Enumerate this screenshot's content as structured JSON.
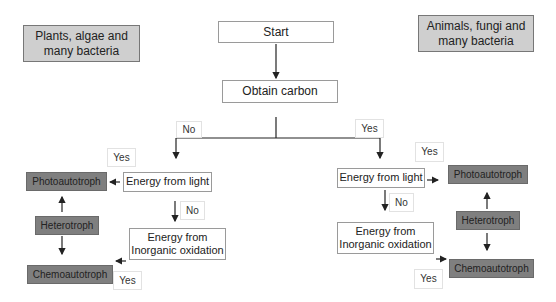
{
  "groups": {
    "left": "Plants, algae and many bacteria",
    "right": "Animals, fungi and many bacteria"
  },
  "flow": {
    "start": "Start",
    "obtain_carbon": "Obtain carbon",
    "branch_no": "No",
    "branch_yes": "Yes"
  },
  "left_branch": {
    "energy_light": "Energy from light",
    "energy_inorganic": "Energy from Inorganic oxidation",
    "yes_light": "Yes",
    "no_light": "No",
    "yes_inorganic": "Yes",
    "photoautotroph": "Photoautotroph",
    "heterotroph": "Heterotroph",
    "chemoautotroph": "Chemoautotroph"
  },
  "right_branch": {
    "energy_light": "Energy from light",
    "energy_inorganic": "Energy from Inorganic oxidation",
    "yes_light": "Yes",
    "no_light": "No",
    "yes_inorganic": "Yes",
    "photoautotroph": "Photoautotroph",
    "heterotroph": "Heterotroph",
    "chemoautotroph": "Chemoautotroph"
  },
  "colors": {
    "group_fill": "#cfcfcf",
    "organism_fill": "#7f7f7f",
    "line": "#222222"
  }
}
